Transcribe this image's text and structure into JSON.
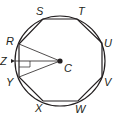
{
  "diagram": {
    "type": "regular octagon inscribed in circle",
    "center": {
      "label": "C",
      "x": 60,
      "y": 61
    },
    "circle_radius": 45,
    "vertices": [
      {
        "label": "R",
        "x": 19,
        "y": 44,
        "lx": 6,
        "ly": 45
      },
      {
        "label": "S",
        "x": 43,
        "y": 19,
        "lx": 36,
        "ly": 15
      },
      {
        "label": "T",
        "x": 77,
        "y": 19,
        "lx": 78,
        "ly": 15
      },
      {
        "label": "U",
        "x": 102,
        "y": 43,
        "lx": 104,
        "ly": 47
      },
      {
        "label": "V",
        "x": 102,
        "y": 77,
        "lx": 104,
        "ly": 86
      },
      {
        "label": "W",
        "x": 78,
        "y": 101,
        "lx": 75,
        "ly": 113
      },
      {
        "label": "X",
        "x": 43,
        "y": 101,
        "lx": 35,
        "ly": 112
      },
      {
        "label": "Y",
        "x": 19,
        "y": 77,
        "lx": 6,
        "ly": 86
      }
    ],
    "point_z": {
      "label": "Z",
      "x": 15,
      "y": 61,
      "lx": 0,
      "ly": 65
    },
    "center_label": {
      "label": "C",
      "lx": 64,
      "ly": 72
    },
    "segments": [
      "CR",
      "CY",
      "CZ"
    ],
    "right_angle_at": "intersection of CZ and RY",
    "stroke_color": "#231f20"
  }
}
